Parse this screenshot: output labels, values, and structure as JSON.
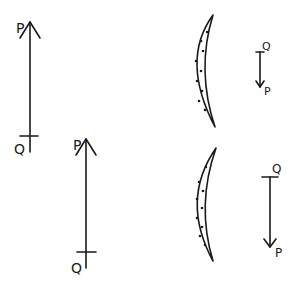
{
  "diagram": {
    "objects": [
      {
        "id": "object-1",
        "top_label": "P",
        "bottom_label": "Q",
        "direction": "up",
        "size": "large"
      },
      {
        "id": "object-2",
        "top_label": "P",
        "bottom_label": "Q",
        "direction": "up",
        "size": "large"
      }
    ],
    "lenses": [
      {
        "id": "lens-1",
        "type": "meniscus-lens"
      },
      {
        "id": "lens-2",
        "type": "meniscus-lens"
      }
    ],
    "images": [
      {
        "id": "image-1",
        "top_label": "Q",
        "bottom_label": "P",
        "direction": "down",
        "size": "small"
      },
      {
        "id": "image-2",
        "top_label": "Q",
        "bottom_label": "P",
        "direction": "down",
        "size": "medium"
      }
    ],
    "colors": {
      "ink": "#1a1a1a",
      "background": "#ffffff"
    }
  }
}
